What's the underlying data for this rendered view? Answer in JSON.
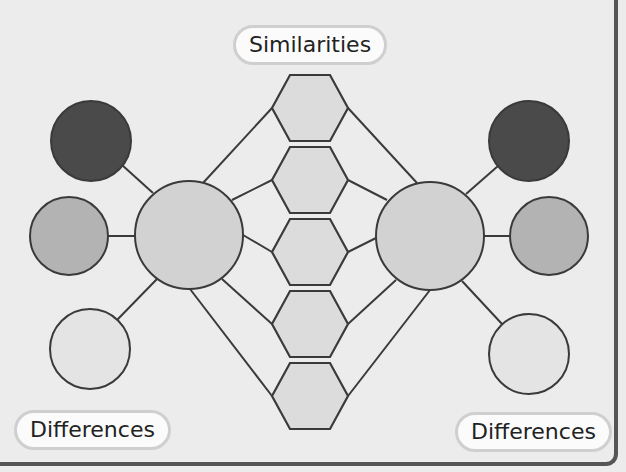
{
  "title_label": "Similarities",
  "left_label": "Differences",
  "right_label": "Differences",
  "colors": {
    "background": "#ececec",
    "line": "#3a3a3a",
    "hexagon_fill": "#dcdcdc",
    "big_circle_fill": "#d2d2d2",
    "dark_circle_fill": "#4a4a4a",
    "mid_circle_fill": "#b3b3b3",
    "light_circle_fill": "#e4e4e4"
  },
  "hexagons": [
    {
      "id": "similarity-1"
    },
    {
      "id": "similarity-2"
    },
    {
      "id": "similarity-3"
    },
    {
      "id": "similarity-4"
    },
    {
      "id": "similarity-5"
    }
  ],
  "left_topic": {
    "difference_circles": [
      "dark",
      "medium",
      "light"
    ]
  },
  "right_topic": {
    "difference_circles": [
      "dark",
      "medium",
      "light"
    ]
  }
}
